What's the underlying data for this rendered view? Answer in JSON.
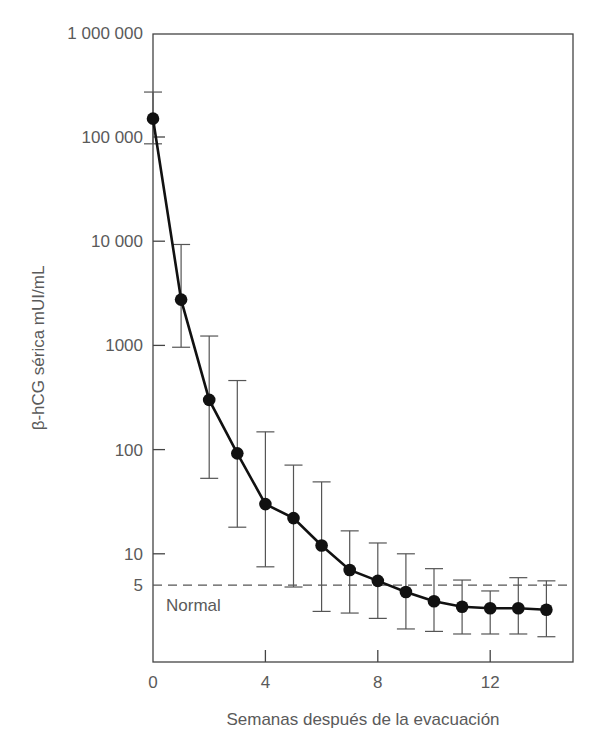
{
  "chart_data": {
    "type": "line",
    "title": "",
    "xlabel": "Semanas después de la evacuación",
    "ylabel": "β-hCG sérica mUI/mL",
    "yscale": "log",
    "xlim": [
      0,
      15
    ],
    "ylim": [
      0.9,
      1000000
    ],
    "grid": false,
    "x_ticks": [
      0,
      4,
      8,
      12
    ],
    "x_tick_labels": [
      "0",
      "4",
      "8",
      "12"
    ],
    "y_ticks": [
      1000000,
      100000,
      10000,
      1000,
      100,
      10,
      5
    ],
    "y_tick_labels": [
      "1 000 000",
      "100 000",
      "10 000",
      "1000",
      "100",
      "10",
      "5"
    ],
    "reference_line": {
      "value": 5,
      "style": "dashed",
      "label": "Normal"
    },
    "series": [
      {
        "name": "β-hCG media",
        "x": [
          0,
          1,
          2,
          3,
          4,
          5,
          6,
          7,
          8,
          9,
          10,
          11,
          12,
          13,
          14
        ],
        "values": [
          150000,
          2750,
          300,
          92,
          30,
          22,
          12,
          7,
          5.5,
          4.3,
          3.5,
          3.1,
          3.0,
          3.0,
          2.9
        ],
        "error_upper": [
          270000,
          9300,
          1230,
          460,
          148,
          71,
          49,
          16.6,
          12.7,
          10,
          7.2,
          5.6,
          4.4,
          5.9,
          5.5
        ],
        "error_lower": [
          86000,
          960,
          53,
          18,
          7.5,
          4.8,
          2.8,
          2.7,
          2.4,
          1.9,
          1.8,
          1.7,
          1.7,
          1.7,
          1.6
        ]
      }
    ]
  }
}
